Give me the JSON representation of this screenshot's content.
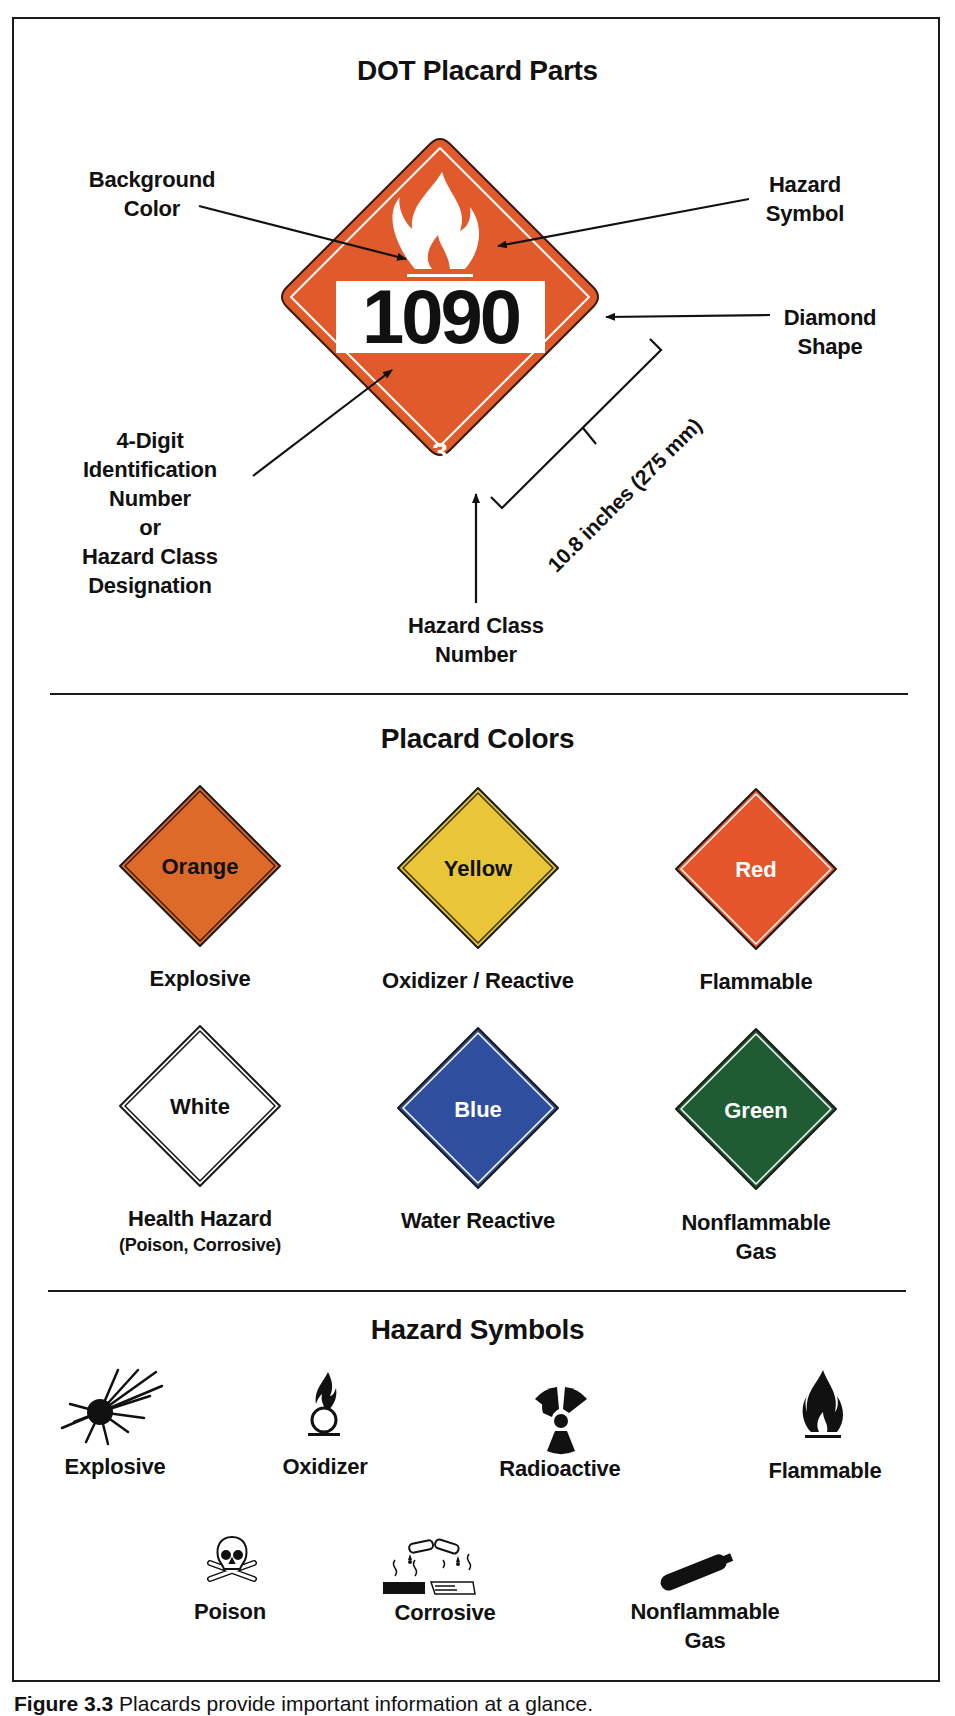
{
  "sections": {
    "parts": {
      "title": "DOT Placard Parts",
      "placard": {
        "id_number": "1090",
        "class_number": "3",
        "background_color": "#e05a2b",
        "symbol": "flame-icon"
      },
      "callouts": {
        "background_color": [
          "Background",
          "Color"
        ],
        "hazard_symbol": [
          "Hazard",
          "Symbol"
        ],
        "diamond_shape": [
          "Diamond",
          "Shape"
        ],
        "id_number": [
          "4-Digit",
          "Identification",
          "Number",
          "or",
          "Hazard Class",
          "Designation"
        ],
        "class_number": [
          "Hazard Class",
          "Number"
        ]
      },
      "dimension": "10.8 inches (275 mm)"
    },
    "colors": {
      "title": "Placard Colors",
      "items": [
        {
          "color_name": "Orange",
          "meaning": "Explosive",
          "subtext": "",
          "fill": "#dd6a28",
          "text_color": "#111111"
        },
        {
          "color_name": "Yellow",
          "meaning": "Oxidizer / Reactive",
          "subtext": "",
          "fill": "#e8c637",
          "text_color": "#111111"
        },
        {
          "color_name": "Red",
          "meaning": "Flammable",
          "subtext": "",
          "fill": "#e4552c",
          "text_color": "#ffffff"
        },
        {
          "color_name": "White",
          "meaning": "Health Hazard",
          "subtext": "(Poison, Corrosive)",
          "fill": "#ffffff",
          "text_color": "#111111"
        },
        {
          "color_name": "Blue",
          "meaning": "Water Reactive",
          "subtext": "",
          "fill": "#2f4f9e",
          "text_color": "#ffffff"
        },
        {
          "color_name": "Green",
          "meaning": "Nonflammable",
          "meaning2": "Gas",
          "subtext": "",
          "fill": "#1f5c33",
          "text_color": "#ffffff"
        }
      ]
    },
    "symbols": {
      "title": "Hazard Symbols",
      "items": [
        {
          "label": "Explosive",
          "icon": "explosive-icon"
        },
        {
          "label": "Oxidizer",
          "icon": "oxidizer-icon"
        },
        {
          "label": "Radioactive",
          "icon": "radioactive-icon"
        },
        {
          "label": "Flammable",
          "icon": "flammable-icon"
        },
        {
          "label": "Poison",
          "icon": "poison-icon"
        },
        {
          "label": "Corrosive",
          "icon": "corrosive-icon"
        },
        {
          "label": "Nonflammable",
          "label2": "Gas",
          "icon": "gas-cylinder-icon"
        }
      ]
    }
  },
  "caption": {
    "figure": "Figure 3.3",
    "text": "Placards provide important information at a glance."
  }
}
